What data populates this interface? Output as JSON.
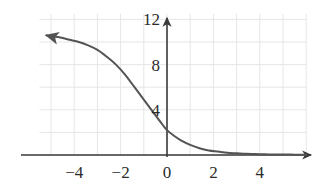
{
  "chart_data": {
    "type": "line",
    "title": "",
    "subtitle": "",
    "xlabel": "",
    "ylabel": "",
    "xlim": [
      -5.5,
      6.0
    ],
    "ylim": [
      0,
      12.5
    ],
    "grid": true,
    "grid_step_x": 1,
    "grid_step_y": 2,
    "legend": "none",
    "x_ticks": [
      -4,
      -2,
      0,
      2,
      4
    ],
    "x_tick_labels": [
      "−4",
      "−2",
      "0",
      "2",
      "4"
    ],
    "y_ticks": [
      4,
      8,
      12
    ],
    "y_tick_labels": [
      "4",
      "8",
      "12"
    ],
    "axis_arrows": {
      "x_positive": true,
      "y_positive": true
    },
    "curve_arrows": {
      "left_end": true,
      "right_end": false
    },
    "annotations": [],
    "series": [
      {
        "name": "logistic decay",
        "type": "line",
        "x": [
          -5.2,
          -5.0,
          -4.6,
          -4.2,
          -3.8,
          -3.4,
          -3.0,
          -2.6,
          -2.2,
          -1.8,
          -1.4,
          -1.0,
          -0.6,
          -0.2,
          0.0,
          0.3,
          0.6,
          1.0,
          1.4,
          1.8,
          2.2,
          2.6,
          3.0,
          3.4,
          3.8,
          4.2,
          4.6,
          5.0,
          5.5,
          6.0
        ],
        "y": [
          10.6,
          10.5,
          10.4,
          10.2,
          10.0,
          9.7,
          9.3,
          8.7,
          8.0,
          7.1,
          6.0,
          4.9,
          3.8,
          2.7,
          2.2,
          1.7,
          1.3,
          0.9,
          0.6,
          0.4,
          0.3,
          0.2,
          0.15,
          0.1,
          0.08,
          0.06,
          0.05,
          0.04,
          0.03,
          0.02
        ]
      }
    ]
  },
  "style": {
    "background": "#ffffff",
    "grid_color": "#e6e6e6",
    "axis_color": "#3a3a3a",
    "curve_color": "#545454",
    "label_color": "#2b2b2b"
  },
  "geometry": {
    "origin_x_px": 167,
    "origin_y_px": 155,
    "unit_x_px": 23.2,
    "unit_y_px": 11.3
  }
}
